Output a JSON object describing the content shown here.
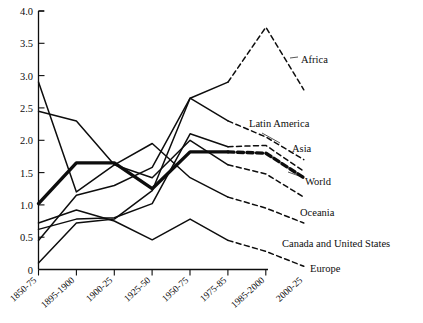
{
  "chart_data": {
    "type": "line",
    "title": "",
    "subtitle": "",
    "xlabel": "",
    "ylabel": "",
    "ylim": [
      0,
      4.0
    ],
    "grid": false,
    "legend_position": "right-inline-labels",
    "y_ticks": [
      "0",
      "0.5",
      "1.0",
      "1.5",
      "2.0",
      "2.5",
      "3.0",
      "3.5",
      "4.0"
    ],
    "y_tick_values": [
      0,
      0.5,
      1.0,
      1.5,
      2.0,
      2.5,
      3.0,
      3.5,
      4.0
    ],
    "categories": [
      "1850-75",
      "1895-1900",
      "1900-25",
      "1925-50",
      "1950-75",
      "1975-85",
      "1985-2000",
      "2000-25"
    ],
    "projection_starts_after": "1975-85",
    "annotations": [
      "Solid segments are historical; dashed segments are projections after 1975-85.",
      "The World series is drawn with a heavier stroke."
    ],
    "series": [
      {
        "name": "Africa",
        "values": [
          0.1,
          0.72,
          0.78,
          1.22,
          2.65,
          2.9,
          3.75,
          2.78
        ],
        "emphasis": "normal",
        "label_anchor": {
          "x": 301,
          "y": 60
        }
      },
      {
        "name": "Latin America",
        "values": [
          0.45,
          1.15,
          1.3,
          1.58,
          2.65,
          2.3,
          2.05,
          1.7
        ],
        "emphasis": "normal",
        "label_anchor": {
          "x": 249,
          "y": 123
        }
      },
      {
        "name": "Asia",
        "values": [
          0.62,
          0.78,
          0.8,
          1.02,
          2.1,
          1.9,
          1.92,
          1.52
        ],
        "emphasis": "normal",
        "label_anchor": {
          "x": 292,
          "y": 148
        }
      },
      {
        "name": "World",
        "values": [
          1.02,
          1.65,
          1.65,
          1.25,
          1.82,
          1.82,
          1.8,
          1.42
        ],
        "emphasis": "heavy",
        "label_anchor": {
          "x": 305,
          "y": 181
        }
      },
      {
        "name": "Oceania",
        "values": [
          2.45,
          2.3,
          1.62,
          1.42,
          2.0,
          1.62,
          1.48,
          1.12
        ],
        "emphasis": "normal",
        "label_anchor": {
          "x": 300,
          "y": 212
        }
      },
      {
        "name": "Canada and United States",
        "values": [
          2.9,
          1.2,
          1.62,
          1.95,
          1.42,
          1.12,
          0.95,
          0.72
        ],
        "emphasis": "normal",
        "label_anchor": {
          "x": 282,
          "y": 243
        }
      },
      {
        "name": "Europe",
        "values": [
          0.72,
          0.92,
          0.75,
          0.46,
          0.78,
          0.45,
          0.28,
          0.05
        ],
        "emphasis": "normal",
        "label_anchor": {
          "x": 310,
          "y": 268
        }
      }
    ]
  },
  "axes": {
    "y_labels": [
      "4.0",
      "3.5",
      "3.0",
      "2.5",
      "2.0",
      "1.5",
      "1.0",
      "0.5",
      "0"
    ],
    "x_labels": [
      "1850-75",
      "1895-1900",
      "1900-25",
      "1925-50",
      "1950-75",
      "1975-85",
      "1985-2000",
      "2000-25"
    ]
  },
  "labels": {
    "africa": "Africa",
    "latin_america": "Latin America",
    "asia": "Asia",
    "world": "World",
    "oceania": "Oceania",
    "canada_us": "Canada and United States",
    "europe": "Europe"
  },
  "colors": {
    "ink": "#0d0d0d",
    "background": "#ffffff"
  }
}
